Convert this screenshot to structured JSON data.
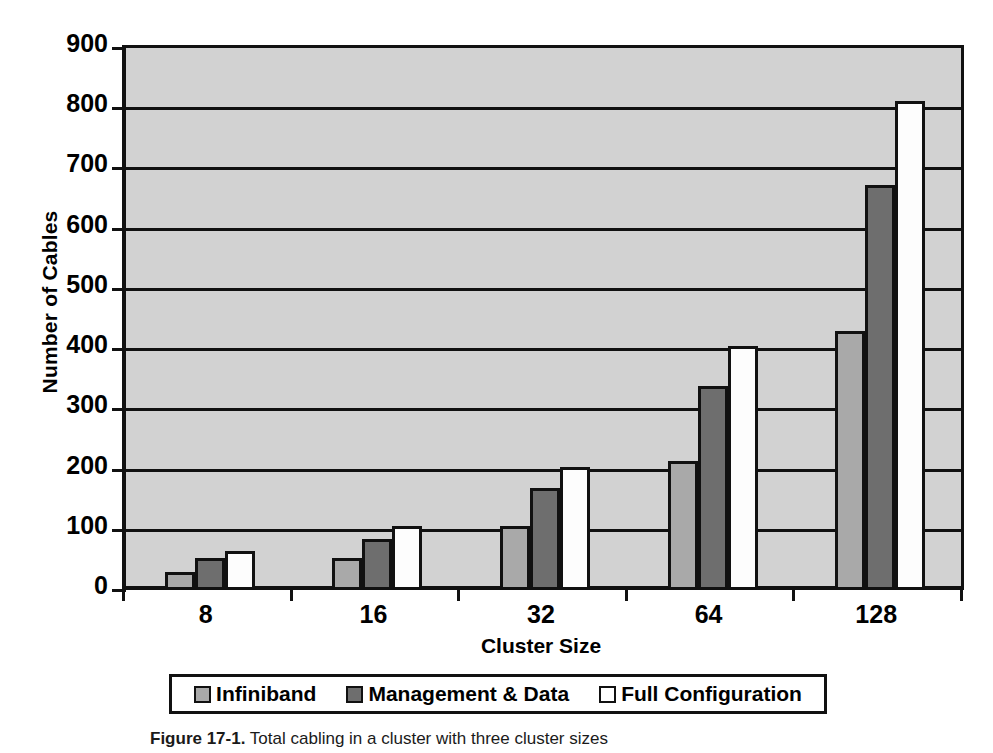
{
  "chart_data": {
    "type": "bar",
    "title": "",
    "categories": [
      "8",
      "16",
      "32",
      "64",
      "128"
    ],
    "series": [
      {
        "name": "Infiniband",
        "color": "#a9a9a9",
        "values": [
          30,
          53,
          107,
          215,
          430
        ]
      },
      {
        "name": "Management & Data",
        "color": "#6e6e6e",
        "values": [
          53,
          85,
          170,
          338,
          673
        ]
      },
      {
        "name": "Full Configuration",
        "color": "#ffffff",
        "values": [
          64,
          107,
          205,
          406,
          812
        ]
      }
    ],
    "xlabel": "Cluster Size",
    "ylabel": "Number of Cables",
    "ylim": [
      0,
      900
    ],
    "ytick_step": 100,
    "yticks": [
      "0",
      "100",
      "200",
      "300",
      "400",
      "500",
      "600",
      "700",
      "800",
      "900"
    ],
    "grid": true,
    "grid_axis": "y",
    "legend_position": "bottom",
    "plot_background": "#d2d2d2",
    "axis_color": "#111111"
  },
  "legend": {
    "items": [
      {
        "label": "Infiniband",
        "swatch": "light-gray-swatch-icon"
      },
      {
        "label": "Management & Data",
        "swatch": "dark-gray-swatch-icon"
      },
      {
        "label": "Full Configuration",
        "swatch": "white-swatch-icon"
      }
    ]
  },
  "caption": {
    "figure_number": "Figure 17-1.",
    "text": "Total cabling in a cluster with three cluster sizes"
  }
}
